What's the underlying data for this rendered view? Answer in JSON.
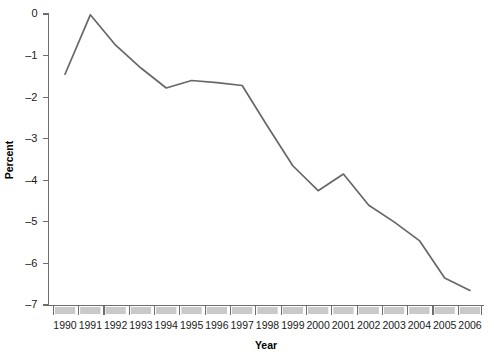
{
  "chart_data": {
    "type": "line",
    "title": "",
    "xlabel": "Year",
    "ylabel": "Percent",
    "categories": [
      "1990",
      "1991",
      "1992",
      "1993",
      "1994",
      "1995",
      "1996",
      "1997",
      "1998",
      "1999",
      "2000",
      "2001",
      "2002",
      "2003",
      "2004",
      "2005",
      "2006"
    ],
    "x": [
      1990,
      1991,
      1992,
      1993,
      1994,
      1995,
      1996,
      1997,
      1998,
      1999,
      2000,
      2001,
      2002,
      2003,
      2004,
      2005,
      2006
    ],
    "values": [
      -1.45,
      -0.02,
      -0.75,
      -1.3,
      -1.78,
      -1.6,
      -1.65,
      -1.72,
      -2.7,
      -3.65,
      -4.25,
      -3.85,
      -4.6,
      -5.0,
      -5.45,
      -6.35,
      -6.65
    ],
    "series": [
      {
        "name": "Percent",
        "values": [
          -1.45,
          -0.02,
          -0.75,
          -1.3,
          -1.78,
          -1.6,
          -1.65,
          -1.72,
          -2.7,
          -3.65,
          -4.25,
          -3.85,
          -4.6,
          -5.0,
          -5.45,
          -6.35,
          -6.65
        ],
        "color": "#676767"
      }
    ],
    "ylim": [
      -7,
      0
    ],
    "xlim": [
      1990,
      2006
    ],
    "ytick_labels": [
      "0",
      "-1",
      "-2",
      "-3",
      "-4",
      "-5",
      "-6",
      "-7"
    ],
    "ytick_values": [
      0,
      -1,
      -2,
      -3,
      -4,
      -5,
      -6,
      -7
    ],
    "grid": false,
    "legend": "none",
    "line_color": "#676767",
    "axis_color": "#6e6e6e",
    "xtick_box_color": "#c9c9c9"
  },
  "axes": {
    "y_title": "Percent",
    "x_title": "Year"
  }
}
